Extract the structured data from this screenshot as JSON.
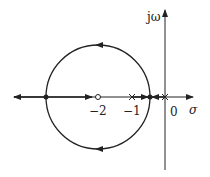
{
  "diagram": {
    "type": "root-locus",
    "axis_labels": {
      "imag": "jω",
      "real": "σ"
    },
    "tick_labels": {
      "minus_two": "−2",
      "minus_one": "−1",
      "zero": "0"
    },
    "poles": [
      0,
      -1
    ],
    "zeros": [
      -2
    ],
    "breakaway_points": [
      -0.586,
      -3.414
    ],
    "circle": {
      "center": -2,
      "radius": 1.414
    },
    "colors": {
      "line": "#222222",
      "background": "#ffffff"
    }
  }
}
